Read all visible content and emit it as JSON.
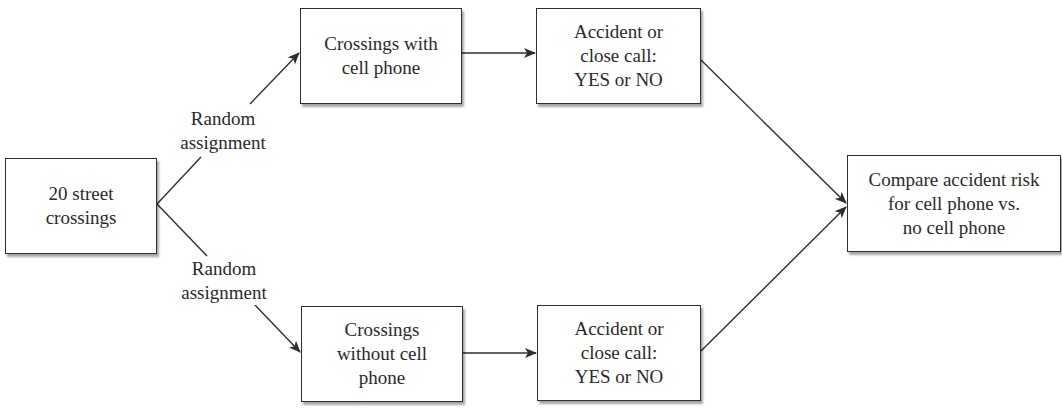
{
  "diagram": {
    "type": "flowchart",
    "nodes": {
      "start": {
        "id": "start",
        "text": "20 street\ncrossings"
      },
      "with_phone": {
        "id": "with_phone",
        "text": "Crossings with\ncell phone"
      },
      "without_phone": {
        "id": "without_phone",
        "text": "Crossings\nwithout cell\nphone"
      },
      "outcome_with": {
        "id": "outcome_with",
        "text": "Accident or\nclose call:\nYES or NO"
      },
      "outcome_without": {
        "id": "outcome_without",
        "text": "Accident or\nclose call:\nYES or NO"
      },
      "compare": {
        "id": "compare",
        "text": "Compare accident risk\nfor cell phone vs.\nno cell phone"
      }
    },
    "edge_labels": {
      "upper": "Random\nassignment",
      "lower": "Random\nassignment"
    },
    "edges": [
      {
        "from": "start",
        "to": "with_phone",
        "label": "Random assignment"
      },
      {
        "from": "start",
        "to": "without_phone",
        "label": "Random assignment"
      },
      {
        "from": "with_phone",
        "to": "outcome_with",
        "label": ""
      },
      {
        "from": "without_phone",
        "to": "outcome_without",
        "label": ""
      },
      {
        "from": "outcome_with",
        "to": "compare",
        "label": ""
      },
      {
        "from": "outcome_without",
        "to": "compare",
        "label": ""
      }
    ],
    "colors": {
      "stroke": "#2f2f2f",
      "background": "#ffffff",
      "text": "#2a2a2a"
    }
  }
}
